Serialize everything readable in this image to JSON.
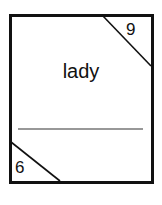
{
  "card": {
    "word": "lady",
    "top_right_number": "9",
    "bottom_left_number": "6",
    "border_color": "#111111",
    "background_color": "#ffffff"
  }
}
